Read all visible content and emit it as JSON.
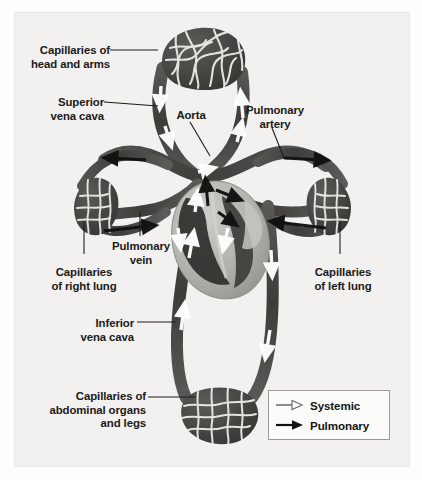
{
  "figure": {
    "type": "anatomical-diagram",
    "background_color": "#f2f1ef",
    "vessel_color": "#4a4a4a",
    "vessel_dark_color": "#33322f",
    "heart_color": "#b9b7b2",
    "arrow_systemic_color": "#ffffff",
    "arrow_pulmonary_color": "#111111"
  },
  "labels": [
    {
      "id": "capillaries-head-arms",
      "text": "Capillaries of\nhead and arms",
      "align": "right",
      "x": 22,
      "y": 44
    },
    {
      "id": "superior-vena-cava",
      "text": "Superior\nvena cava",
      "align": "right",
      "x": 43,
      "y": 96
    },
    {
      "id": "aorta",
      "text": "Aorta",
      "align": "center",
      "x": 174,
      "y": 109
    },
    {
      "id": "pulmonary-artery",
      "text": "Pulmonary\nartery",
      "align": "center",
      "x": 244,
      "y": 104
    },
    {
      "id": "pulmonary-vein",
      "text": "Pulmonary\nvein",
      "align": "center",
      "x": 111,
      "y": 240
    },
    {
      "id": "capillaries-right-lung",
      "text": "Capillaries\nof right lung",
      "align": "center",
      "x": 47,
      "y": 266
    },
    {
      "id": "capillaries-left-lung",
      "text": "Capillaries\nof left lung",
      "align": "center",
      "x": 314,
      "y": 266
    },
    {
      "id": "inferior-vena-cava",
      "text": "Inferior\nvena cava",
      "align": "right",
      "x": 84,
      "y": 317
    },
    {
      "id": "capillaries-abdominal",
      "text": "Capillaries of\nabdominal organs\nand legs",
      "align": "right",
      "x": 22,
      "y": 390
    }
  ],
  "legend": {
    "items": [
      {
        "id": "legend-systemic",
        "label": "Systemic",
        "arrow": "hollow-arrow-icon",
        "color": "#8d8d8d"
      },
      {
        "id": "legend-pulmonary",
        "label": "Pulmonary",
        "arrow": "solid-arrow-icon",
        "color": "#111111"
      }
    ]
  }
}
